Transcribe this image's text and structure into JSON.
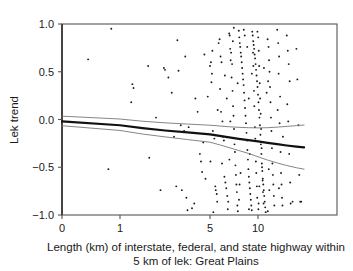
{
  "chart_data": {
    "type": "scatter",
    "title": "",
    "subtitle": "",
    "xlabel_line1": "Length (km) of interstate, federal, and state highway within",
    "xlabel_line2": "5 km of lek: Great Plains",
    "ylabel": "Lek trend",
    "xlim": [
      0,
      14.8
    ],
    "ylim": [
      -1.0,
      1.0
    ],
    "grid": false,
    "legend": "none",
    "x_scale": "nonlinear-compressed",
    "xticks": [
      0,
      1,
      5,
      10
    ],
    "xticklabels": [
      "0",
      "1",
      "5",
      "10"
    ],
    "xtick_positions_px": [
      62,
      120,
      210,
      258
    ],
    "yticks": [
      1.0,
      0.5,
      0.0,
      -0.5,
      -1.0
    ],
    "yticklabels": [
      "1.0",
      "0.5",
      "0.0",
      "-0.5",
      "-1.0"
    ],
    "point_color": "#1a1a1a",
    "point_size_px": 1.9,
    "fit_line_color": "#111111",
    "fit_line_width_px": 2.2,
    "ci_line_color": "#777777",
    "ci_line_width_px": 0.9,
    "axis_color": "#555555",
    "n_points": 232,
    "series": [
      {
        "name": "Leks",
        "points": [
          [
            0.85,
            0.95
          ],
          [
            0.45,
            0.63
          ],
          [
            1.55,
            0.37
          ],
          [
            1.6,
            0.33
          ],
          [
            2.25,
            0.56
          ],
          [
            1.5,
            0.18
          ],
          [
            0.8,
            -0.52
          ],
          [
            2.3,
            -0.4
          ],
          [
            2.95,
            0.54
          ],
          [
            3.0,
            0.52
          ],
          [
            3.15,
            0.44
          ],
          [
            3.6,
            0.51
          ],
          [
            3.55,
            0.83
          ],
          [
            3.7,
            -0.06
          ],
          [
            3.85,
            -0.12
          ],
          [
            3.4,
            -0.18
          ],
          [
            3.5,
            -0.7
          ],
          [
            3.75,
            -0.74
          ],
          [
            4.0,
            -0.95
          ],
          [
            4.2,
            -0.93
          ],
          [
            4.3,
            -0.88
          ],
          [
            4.55,
            -0.36
          ],
          [
            4.6,
            -0.44
          ],
          [
            4.65,
            -0.55
          ],
          [
            4.8,
            -0.62
          ],
          [
            4.35,
            0.22
          ],
          [
            4.9,
            0.24
          ],
          [
            4.7,
            -0.24
          ],
          [
            5.0,
            0.56
          ],
          [
            5.1,
            0.6
          ],
          [
            5.2,
            0.48
          ],
          [
            5.15,
            0.39
          ],
          [
            5.3,
            -0.12
          ],
          [
            5.4,
            -0.16
          ],
          [
            5.45,
            -0.2
          ],
          [
            5.55,
            -0.7
          ],
          [
            5.6,
            -0.74
          ],
          [
            5.7,
            -0.78
          ],
          [
            5.35,
            -0.97
          ],
          [
            5.9,
            0.8
          ],
          [
            6.0,
            0.84
          ],
          [
            6.1,
            0.66
          ],
          [
            6.2,
            0.6
          ],
          [
            6.15,
            0.08
          ],
          [
            6.3,
            -0.02
          ],
          [
            6.35,
            -0.18
          ],
          [
            6.45,
            -0.22
          ],
          [
            6.5,
            -0.6
          ],
          [
            6.6,
            -0.66
          ],
          [
            6.7,
            -0.72
          ],
          [
            6.8,
            -0.8
          ],
          [
            6.9,
            -0.86
          ],
          [
            7.0,
            0.9
          ],
          [
            7.05,
            0.88
          ],
          [
            7.1,
            0.74
          ],
          [
            7.2,
            0.7
          ],
          [
            7.15,
            0.62
          ],
          [
            7.3,
            0.58
          ],
          [
            7.25,
            0.44
          ],
          [
            7.35,
            0.3
          ],
          [
            7.4,
            0.14
          ],
          [
            7.45,
            0.04
          ],
          [
            7.5,
            -0.1
          ],
          [
            7.55,
            -0.26
          ],
          [
            7.6,
            -0.34
          ],
          [
            7.65,
            -0.48
          ],
          [
            7.7,
            -0.58
          ],
          [
            7.75,
            -0.68
          ],
          [
            7.8,
            -0.76
          ],
          [
            7.85,
            -0.9
          ],
          [
            7.9,
            -0.96
          ],
          [
            8.0,
            0.93
          ],
          [
            8.05,
            0.86
          ],
          [
            8.1,
            0.8
          ],
          [
            8.15,
            0.76
          ],
          [
            8.2,
            0.7
          ],
          [
            8.25,
            0.66
          ],
          [
            8.3,
            0.6
          ],
          [
            8.35,
            0.54
          ],
          [
            8.4,
            0.48
          ],
          [
            8.45,
            0.42
          ],
          [
            8.5,
            0.36
          ],
          [
            8.55,
            0.28
          ],
          [
            8.6,
            0.2
          ],
          [
            8.65,
            0.12
          ],
          [
            8.7,
            0.04
          ],
          [
            8.75,
            -0.04
          ],
          [
            8.8,
            -0.14
          ],
          [
            8.85,
            -0.22
          ],
          [
            8.9,
            -0.32
          ],
          [
            8.95,
            -0.42
          ],
          [
            9.0,
            -0.52
          ],
          [
            9.05,
            -0.6
          ],
          [
            9.1,
            -0.66
          ],
          [
            9.15,
            -0.72
          ],
          [
            9.2,
            -0.78
          ],
          [
            9.25,
            -0.84
          ],
          [
            9.3,
            -0.9
          ],
          [
            9.35,
            -0.95
          ],
          [
            9.4,
            0.92
          ],
          [
            9.45,
            0.88
          ],
          [
            9.5,
            0.82
          ],
          [
            9.55,
            0.78
          ],
          [
            9.6,
            0.74
          ],
          [
            9.65,
            0.68
          ],
          [
            9.7,
            0.64
          ],
          [
            9.75,
            0.58
          ],
          [
            9.8,
            0.52
          ],
          [
            9.85,
            0.46
          ],
          [
            9.9,
            0.4
          ],
          [
            9.95,
            0.34
          ],
          [
            10.0,
            0.26
          ],
          [
            10.05,
            0.18
          ],
          [
            10.1,
            0.1
          ],
          [
            10.15,
            0.02
          ],
          [
            10.2,
            -0.06
          ],
          [
            10.25,
            -0.16
          ],
          [
            10.3,
            -0.26
          ],
          [
            10.35,
            -0.36
          ],
          [
            10.4,
            -0.46
          ],
          [
            10.45,
            -0.54
          ],
          [
            10.5,
            -0.62
          ],
          [
            10.55,
            -0.68
          ],
          [
            10.6,
            -0.74
          ],
          [
            10.65,
            -0.8
          ],
          [
            10.7,
            -0.86
          ],
          [
            10.75,
            -0.92
          ],
          [
            10.8,
            -0.97
          ],
          [
            9.48,
            0.7
          ],
          [
            9.52,
            0.56
          ],
          [
            9.58,
            0.3
          ],
          [
            9.62,
            0.14
          ],
          [
            9.68,
            -0.08
          ],
          [
            9.72,
            -0.2
          ],
          [
            9.78,
            -0.44
          ],
          [
            9.82,
            -0.56
          ],
          [
            9.88,
            -0.7
          ],
          [
            9.92,
            -0.82
          ],
          [
            10.02,
            0.86
          ],
          [
            10.08,
            0.72
          ],
          [
            10.12,
            0.56
          ],
          [
            10.18,
            0.38
          ],
          [
            10.22,
            0.22
          ],
          [
            10.28,
            0.06
          ],
          [
            10.32,
            -0.1
          ],
          [
            10.38,
            -0.3
          ],
          [
            10.42,
            -0.5
          ],
          [
            10.48,
            -0.64
          ],
          [
            10.52,
            -0.76
          ],
          [
            10.58,
            -0.88
          ],
          [
            11.0,
            0.84
          ],
          [
            11.1,
            0.76
          ],
          [
            11.15,
            0.62
          ],
          [
            11.2,
            0.5
          ],
          [
            11.25,
            0.34
          ],
          [
            11.3,
            0.18
          ],
          [
            11.35,
            0.02
          ],
          [
            11.4,
            -0.12
          ],
          [
            11.45,
            -0.3
          ],
          [
            11.5,
            -0.46
          ],
          [
            11.55,
            -0.58
          ],
          [
            11.6,
            -0.68
          ],
          [
            11.65,
            -0.8
          ],
          [
            11.7,
            -0.9
          ],
          [
            12.0,
            0.94
          ],
          [
            12.1,
            0.8
          ],
          [
            12.2,
            0.66
          ],
          [
            12.15,
            0.48
          ],
          [
            12.3,
            0.24
          ],
          [
            12.25,
            -0.04
          ],
          [
            12.35,
            -0.34
          ],
          [
            12.4,
            -0.56
          ],
          [
            12.45,
            -0.68
          ],
          [
            12.5,
            -0.82
          ],
          [
            12.55,
            -0.9
          ],
          [
            13.0,
            0.88
          ],
          [
            13.1,
            0.72
          ],
          [
            13.2,
            0.58
          ],
          [
            13.3,
            0.4
          ],
          [
            13.15,
            -0.02
          ],
          [
            13.25,
            -0.36
          ],
          [
            13.35,
            -0.66
          ],
          [
            13.4,
            -0.88
          ],
          [
            14.0,
            0.74
          ],
          [
            14.1,
            0.42
          ],
          [
            14.2,
            -0.06
          ],
          [
            14.3,
            -0.58
          ],
          [
            14.4,
            -0.86
          ],
          [
            5.8,
            0.1
          ],
          [
            6.05,
            0.32
          ],
          [
            7.12,
            -0.02
          ],
          [
            8.08,
            -0.68
          ],
          [
            9.04,
            0.22
          ],
          [
            10.06,
            -0.88
          ],
          [
            11.05,
            0.4
          ],
          [
            12.05,
            0.1
          ],
          [
            3.9,
            0.66
          ],
          [
            4.45,
            0.08
          ],
          [
            2.6,
            0.02
          ],
          [
            5.25,
            0.72
          ],
          [
            6.55,
            0.46
          ],
          [
            7.38,
            0.82
          ],
          [
            8.62,
            0.88
          ],
          [
            9.36,
            0.48
          ],
          [
            10.62,
            0.54
          ],
          [
            11.12,
            -0.52
          ],
          [
            12.18,
            -0.72
          ],
          [
            13.05,
            0.16
          ],
          [
            4.05,
            -0.08
          ],
          [
            5.05,
            -0.44
          ],
          [
            6.25,
            -0.46
          ],
          [
            7.02,
            -0.42
          ],
          [
            8.18,
            -0.56
          ],
          [
            9.14,
            -0.36
          ],
          [
            10.14,
            -0.7
          ],
          [
            11.18,
            -0.74
          ],
          [
            3.3,
            0.28
          ],
          [
            4.75,
            0.68
          ],
          [
            6.75,
            0.22
          ],
          [
            7.88,
            0.38
          ],
          [
            8.88,
            0.76
          ],
          [
            9.94,
            0.92
          ],
          [
            10.9,
            0.28
          ],
          [
            12.6,
            -0.18
          ],
          [
            2.8,
            -0.74
          ],
          [
            3.95,
            -0.82
          ],
          [
            5.75,
            -0.86
          ],
          [
            6.85,
            -0.94
          ],
          [
            8.02,
            -0.84
          ],
          [
            9.06,
            -0.94
          ],
          [
            10.04,
            -0.94
          ],
          [
            11.02,
            -0.96
          ],
          [
            13.6,
            -0.86
          ],
          [
            14.5,
            -0.86
          ],
          [
            7.48,
            0.96
          ],
          [
            8.52,
            0.94
          ]
        ]
      }
    ],
    "fit_line": {
      "name": "Regression fit",
      "points": [
        [
          0,
          -0.02
        ],
        [
          1,
          -0.06
        ],
        [
          2,
          -0.09
        ],
        [
          3,
          -0.115
        ],
        [
          4,
          -0.135
        ],
        [
          5,
          -0.155
        ],
        [
          6,
          -0.172
        ],
        [
          7,
          -0.188
        ],
        [
          8,
          -0.202
        ],
        [
          9,
          -0.216
        ],
        [
          10,
          -0.229
        ],
        [
          11,
          -0.244
        ],
        [
          12,
          -0.258
        ],
        [
          13,
          -0.272
        ],
        [
          14,
          -0.284
        ],
        [
          14.8,
          -0.292
        ]
      ]
    },
    "ci_upper": {
      "name": "Upper 95% confidence limit",
      "points": [
        [
          0,
          0.035
        ],
        [
          1,
          0.005
        ],
        [
          2,
          -0.018
        ],
        [
          3,
          -0.035
        ],
        [
          4,
          -0.048
        ],
        [
          5,
          -0.06
        ],
        [
          6,
          -0.068
        ],
        [
          7,
          -0.076
        ],
        [
          8,
          -0.082
        ],
        [
          9,
          -0.086
        ],
        [
          10,
          -0.088
        ],
        [
          11,
          -0.086
        ],
        [
          12,
          -0.08
        ],
        [
          13,
          -0.072
        ],
        [
          14,
          -0.064
        ],
        [
          14.8,
          -0.058
        ]
      ]
    },
    "ci_lower": {
      "name": "Lower 95% confidence limit",
      "points": [
        [
          0,
          -0.065
        ],
        [
          1,
          -0.115
        ],
        [
          2,
          -0.152
        ],
        [
          3,
          -0.182
        ],
        [
          4,
          -0.21
        ],
        [
          5,
          -0.238
        ],
        [
          6,
          -0.265
        ],
        [
          7,
          -0.295
        ],
        [
          8,
          -0.325
        ],
        [
          9,
          -0.355
        ],
        [
          10,
          -0.39
        ],
        [
          11,
          -0.425
        ],
        [
          12,
          -0.455
        ],
        [
          13,
          -0.482
        ],
        [
          14,
          -0.505
        ],
        [
          14.8,
          -0.52
        ]
      ]
    }
  }
}
